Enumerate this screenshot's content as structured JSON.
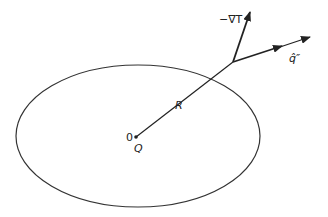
{
  "diagram": {
    "labels": {
      "neg_grad_t": "−∇T",
      "heat_flux": "q̂″",
      "radius": "R",
      "origin": "0",
      "source": "Q"
    },
    "colors": {
      "stroke": "#222222",
      "background": "#ffffff"
    }
  }
}
